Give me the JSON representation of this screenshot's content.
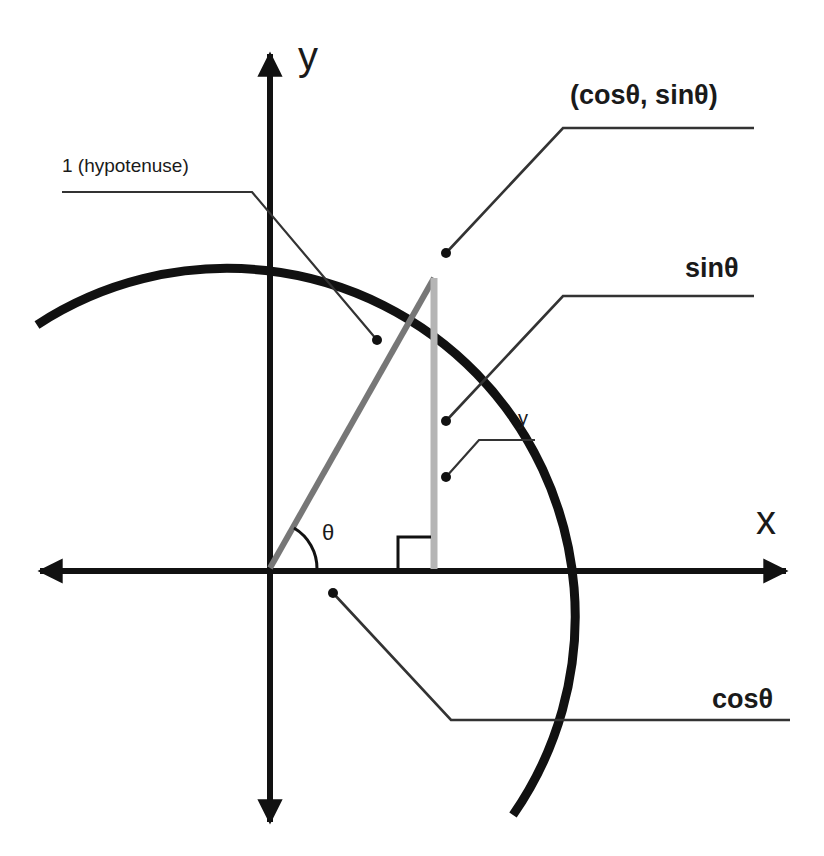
{
  "diagram": {
    "colors": {
      "ink": "#111111",
      "hypotenuse": "#777777",
      "opposite_side": "#b5b5b5",
      "leader": "#333333",
      "background": "#ffffff"
    },
    "axes": {
      "x_label": "x",
      "y_label": "y"
    },
    "angle_label": "θ",
    "labels": {
      "hypotenuse": "1 (hypotenuse)",
      "point": "(cosθ, sinθ)",
      "sin": "sinθ",
      "y_side": "y",
      "cos": "cosθ"
    },
    "elements": [
      {
        "name": "unit-circle-arc",
        "description": "arc of circle radius 1 centered at origin"
      },
      {
        "name": "hypotenuse",
        "description": "segment from origin to (cosθ, sinθ)"
      },
      {
        "name": "opposite-side",
        "description": "vertical segment from point down to x-axis"
      },
      {
        "name": "right-angle-marker",
        "description": "square at foot of vertical side"
      },
      {
        "name": "angle-arc",
        "description": "arc marking θ at origin"
      }
    ]
  }
}
